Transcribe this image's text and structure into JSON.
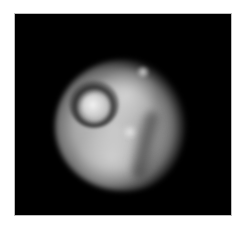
{
  "image": {
    "subject": "grayscale micrograph of a single rounded cell with a bright nucleus",
    "background_color": "#000000",
    "border_color": "#ffffff",
    "features": [
      {
        "name": "cell-body",
        "tone": "light gray"
      },
      {
        "name": "nucleus",
        "tone": "bright white"
      },
      {
        "name": "nucleus-ring",
        "tone": "dark"
      },
      {
        "name": "crease",
        "tone": "dark gray"
      }
    ]
  },
  "caption": ""
}
